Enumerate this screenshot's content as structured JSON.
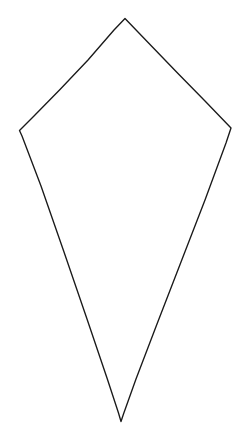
{
  "canvas": {
    "width": 241,
    "height": 445,
    "background_color": "#ffffff",
    "description": "hand-drawn kite outline"
  },
  "shape": {
    "name": "kite",
    "type": "closed-polygon",
    "stroke_color": "#1a1a1a",
    "stroke_width": 1.35,
    "fill": "none",
    "vertices": [
      {
        "name": "top-apex",
        "x": 125,
        "y": 18
      },
      {
        "name": "right-shoulder",
        "x": 231,
        "y": 128
      },
      {
        "name": "bottom-tip",
        "x": 122,
        "y": 421
      },
      {
        "name": "left-shoulder",
        "x": 19,
        "y": 131
      }
    ],
    "edges": [
      {
        "name": "upper-right-edge",
        "from": "top-apex",
        "to": "right-shoulder"
      },
      {
        "name": "lower-right-edge",
        "from": "right-shoulder",
        "to": "bottom-tip"
      },
      {
        "name": "lower-left-edge",
        "from": "bottom-tip",
        "to": "left-shoulder"
      },
      {
        "name": "upper-left-edge",
        "from": "left-shoulder",
        "to": "top-apex"
      }
    ],
    "path_d": "M 125.0 18.5 L 150.5 45.0 L 178.0 73.5 L 205.0 101.0 L 231.0 128.0 L 226.0 143.0 L 205.0 200.0 L 181.0 262.0 L 157.0 324.0 L 136.0 379.0 L 123.5 414.0 L 121.0 421.5 L 118.5 413.0 L 107.0 378.0 L 87.0 319.0 L 64.0 252.0 L 41.0 186.0 L 22.0 136.0 L 19.5 130.5 L 34.0 116.0 L 60.0 89.5 L 88.0 60.0 L 114.0 30.0 L 125.0 18.5 Z"
  }
}
